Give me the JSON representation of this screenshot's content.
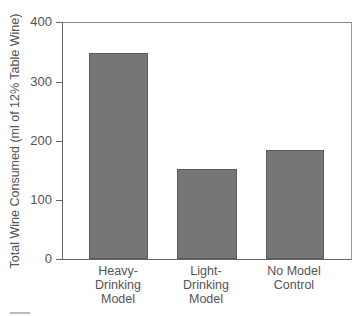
{
  "chart_data": {
    "type": "bar",
    "title": "",
    "xlabel": "",
    "ylabel": "Total Wine Consumed (ml of 12% Table Wine)",
    "categories": [
      "Heavy-\nDrinking\nModel",
      "Light-\nDrinking\nModel",
      "No Model\nControl"
    ],
    "values": [
      350,
      153,
      185
    ],
    "ylim": [
      0,
      400
    ],
    "yticks": [
      0,
      100,
      200,
      300,
      400
    ],
    "grid": false,
    "legend": null,
    "bar_color": "#767676"
  },
  "labels": {
    "ylabel": "Total Wine Consumed (ml of 12% Table Wine)",
    "yticks": [
      "0",
      "100",
      "200",
      "300",
      "400"
    ],
    "categories": [
      "Heavy-\nDrinking\nModel",
      "Light-\nDrinking\nModel",
      "No Model\nControl"
    ]
  }
}
